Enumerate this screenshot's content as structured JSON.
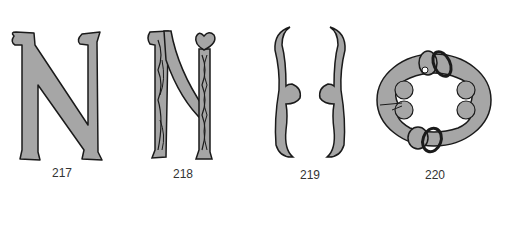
{
  "figures": [
    {
      "id": "217",
      "caption": "217",
      "description": "Plain letter N with serifs"
    },
    {
      "id": "218",
      "caption": "218",
      "description": "Letter N with vine decoration and heart terminal"
    },
    {
      "id": "219",
      "caption": "219",
      "description": "Mirrored bracket form"
    },
    {
      "id": "220",
      "caption": "220",
      "description": "Oval interlaced knot ring"
    }
  ],
  "colors": {
    "fill": "#a6a6a6",
    "stroke": "#1a1a1a",
    "background": "#ffffff"
  }
}
